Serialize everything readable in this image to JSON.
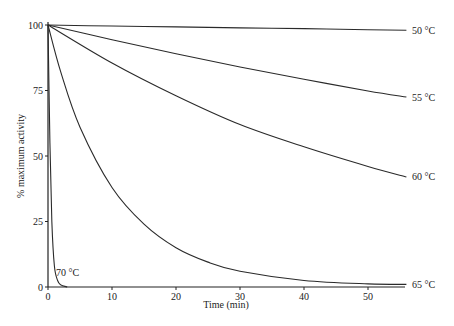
{
  "chart_data": {
    "type": "line",
    "title": "",
    "xlabel": "Time (min)",
    "ylabel": "% maximum activity",
    "xlim": [
      0,
      56
    ],
    "ylim": [
      0,
      100
    ],
    "x_ticks": [
      0,
      10,
      20,
      30,
      40,
      50
    ],
    "y_ticks": [
      0,
      25,
      50,
      75,
      100
    ],
    "grid": false,
    "legend": "inline labels at right end of curves",
    "series": [
      {
        "name": "50 °C",
        "label": "50 °C",
        "x": [
          0,
          10,
          20,
          30,
          40,
          50,
          56
        ],
        "values": [
          100,
          99.6,
          99.3,
          98.9,
          98.6,
          98.2,
          98
        ]
      },
      {
        "name": "55 °C",
        "label": "55 °C",
        "x": [
          0,
          10,
          20,
          30,
          40,
          50,
          56
        ],
        "values": [
          100,
          94.4,
          89,
          84,
          79.3,
          74.8,
          72.5
        ]
      },
      {
        "name": "60 °C",
        "label": "60 °C",
        "x": [
          0,
          10,
          20,
          30,
          40,
          50,
          56
        ],
        "values": [
          100,
          85.5,
          73,
          62,
          53.5,
          46,
          42
        ]
      },
      {
        "name": "65 °C",
        "label": "65 °C",
        "x": [
          0,
          2,
          5,
          10,
          15,
          20,
          25,
          30,
          40,
          50,
          56
        ],
        "values": [
          100,
          82,
          61,
          38,
          24,
          15,
          9.5,
          6,
          2.5,
          1.2,
          1
        ]
      },
      {
        "name": "70 °C",
        "label": "70 °C",
        "x": [
          0,
          0.3,
          0.6,
          1,
          1.5,
          2,
          3
        ],
        "values": [
          100,
          55,
          25,
          8,
          2.5,
          0.8,
          0
        ]
      }
    ]
  },
  "axes": {
    "x_title": "Time (min)",
    "y_title": "% maximum activity",
    "x_tick_labels": [
      "0",
      "10",
      "20",
      "30",
      "40",
      "50"
    ],
    "y_tick_labels": [
      "0",
      "25",
      "50",
      "75",
      "100"
    ]
  },
  "curve_labels": [
    "50 °C",
    "55 °C",
    "60 °C",
    "65 °C",
    "70 °C"
  ]
}
